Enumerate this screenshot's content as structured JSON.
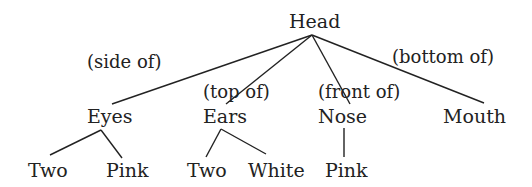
{
  "diagram": {
    "type": "tree",
    "root": "Head",
    "nodes": {
      "head": "Head",
      "eyes": "Eyes",
      "ears": "Ears",
      "nose": "Nose",
      "mouth": "Mouth",
      "eyes_two": "Two",
      "eyes_pink": "Pink",
      "ears_two": "Two",
      "ears_white": "White",
      "nose_pink": "Pink"
    },
    "edge_labels": {
      "head_eyes": "(side of)",
      "head_ears": "(top of)",
      "head_nose": "(front of)",
      "head_mouth": "(bottom of)"
    },
    "edges": [
      {
        "from": "Head",
        "to": "Eyes",
        "label": "(side of)"
      },
      {
        "from": "Head",
        "to": "Ears",
        "label": "(top of)"
      },
      {
        "from": "Head",
        "to": "Nose",
        "label": "(front of)"
      },
      {
        "from": "Head",
        "to": "Mouth",
        "label": "(bottom of)"
      },
      {
        "from": "Eyes",
        "to": "Two"
      },
      {
        "from": "Eyes",
        "to": "Pink"
      },
      {
        "from": "Ears",
        "to": "Two"
      },
      {
        "from": "Ears",
        "to": "White"
      },
      {
        "from": "Nose",
        "to": "Pink"
      }
    ]
  }
}
